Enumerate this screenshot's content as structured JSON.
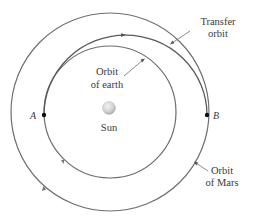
{
  "diagram": {
    "type": "hohmann-transfer-orbit",
    "labels": {
      "transfer_line1": "Transfer",
      "transfer_line2": "orbit",
      "earth_line1": "Orbit",
      "earth_line2": "of earth",
      "mars_line1": "Orbit",
      "mars_line2": "of Mars",
      "sun": "Sun",
      "point_a": "A",
      "point_b": "B"
    },
    "colors": {
      "orbit_stroke": "#6e6e6e",
      "text": "#3a3a3a",
      "sun_fill": "#d8d8d8",
      "point": "#111111"
    }
  }
}
